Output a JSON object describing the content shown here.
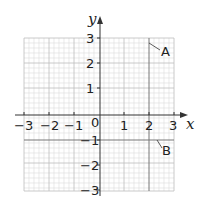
{
  "diagram": {
    "type": "coordinate-grid",
    "x_axis_label": "x",
    "y_axis_label": "y",
    "x_range": [
      -3,
      3
    ],
    "y_range": [
      -3,
      3
    ],
    "origin_label": "0",
    "x_ticks": [
      "−3",
      "−2",
      "−1",
      "1",
      "2",
      "3"
    ],
    "y_ticks": [
      "3",
      "2",
      "1",
      "−1",
      "−2",
      "−3"
    ],
    "lines": [
      {
        "label": "A",
        "equation": "x = 2",
        "orientation": "vertical"
      },
      {
        "label": "B",
        "equation": "y = −1",
        "orientation": "horizontal"
      }
    ],
    "colors": {
      "grid_minor": "#d8d8d8",
      "grid_major": "#b8b8b8",
      "axes": "#333333",
      "lines": "#777777",
      "text": "#222222"
    }
  }
}
